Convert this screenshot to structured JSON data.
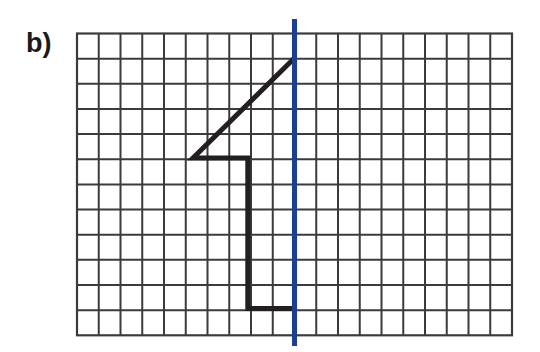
{
  "figure": {
    "label": "b)",
    "background_color": "#ffffff"
  },
  "grid": {
    "x0": 77,
    "y0": 33.5,
    "cols": 20,
    "rows": 12,
    "cell_width": 21.75,
    "cell_height": 25.15,
    "line_color": "#3b3b3b",
    "line_width": 2.0,
    "border_color": "#3b3b3b",
    "border_width": 2.2
  },
  "mirror_line": {
    "name": "axis-of-symmetry",
    "color": "#1c3f94",
    "width": 5,
    "column_index": 10,
    "x": 294.5,
    "y_top": 19,
    "y_bottom": 346
  },
  "shape": {
    "name": "half-figure-outline",
    "color": "#231f20",
    "width": 5,
    "points": [
      [
        294.5,
        58.0
      ],
      [
        193.0,
        158.0
      ],
      [
        247.8,
        158.0
      ],
      [
        247.8,
        308.5
      ],
      [
        294.5,
        308.5
      ]
    ],
    "grid_points": [
      [
        10,
        1
      ],
      [
        5.33,
        5
      ],
      [
        7.85,
        5
      ],
      [
        7.85,
        11
      ],
      [
        10,
        11
      ]
    ]
  },
  "chart_data": {
    "type": "line",
    "title": "b)",
    "xlabel": "",
    "ylabel": "",
    "grid": true,
    "legend": "none",
    "xlim": [
      0,
      20
    ],
    "ylim": [
      0,
      12
    ],
    "series": [
      {
        "name": "half-shape",
        "x": [
          10,
          5.33,
          7.85,
          7.85,
          10
        ],
        "y": [
          1,
          5,
          5,
          11,
          11
        ],
        "color": "#231f20"
      },
      {
        "name": "mirror-line",
        "x": [
          10,
          10
        ],
        "y": [
          -0.6,
          12.4
        ],
        "color": "#1c3f94"
      }
    ]
  }
}
